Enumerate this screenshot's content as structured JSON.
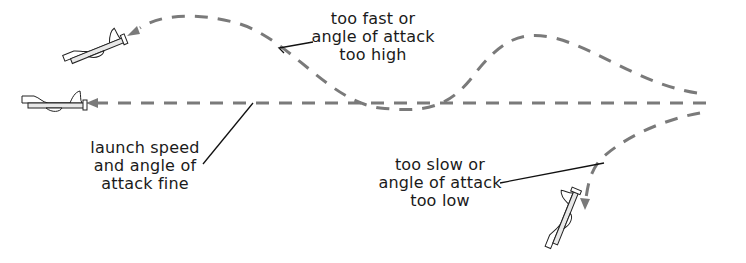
{
  "diagram": {
    "trajectories": [
      {
        "id": "high",
        "label_lines": [
          "too fast or",
          "angle of attack",
          "too high"
        ],
        "outcome": "glider loops up and stalls"
      },
      {
        "id": "fine",
        "label_lines": [
          "launch speed",
          "and angle of",
          "attack fine"
        ],
        "outcome": "glider flies straight"
      },
      {
        "id": "low",
        "label_lines": [
          "too slow or",
          "angle of attack",
          "too low"
        ],
        "outcome": "glider dives down"
      }
    ],
    "colors": {
      "path": "#7a7a7a",
      "leader": "#111111",
      "text": "#1a1a1a",
      "background": "#ffffff"
    },
    "icons": {
      "glider": "glider-plane-icon",
      "arrow": "arrowhead-icon"
    }
  }
}
